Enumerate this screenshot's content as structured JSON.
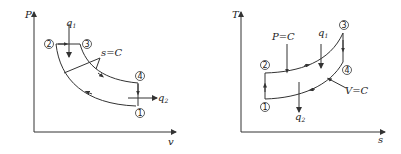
{
  "pv_diagram": {
    "y_axis_label": "P",
    "x_axis_label": "v",
    "points": {
      "p1": "1",
      "p2": "2",
      "p3": "3",
      "p4": "4"
    },
    "heat_in": "q",
    "heat_in_sub": "1",
    "heat_out": "q",
    "heat_out_sub": "2",
    "isentrope_label": "s=C"
  },
  "ts_diagram": {
    "y_axis_label": "T",
    "x_axis_label": "s",
    "points": {
      "p1": "1",
      "p2": "2",
      "p3": "3",
      "p4": "4"
    },
    "heat_in": "q",
    "heat_in_sub": "1",
    "heat_out": "q",
    "heat_out_sub": "2",
    "isobar_label": "P=C",
    "isochore_label": "V=C"
  },
  "colors": {
    "line": "#333333",
    "text": "#222222",
    "background": "#ffffff"
  }
}
